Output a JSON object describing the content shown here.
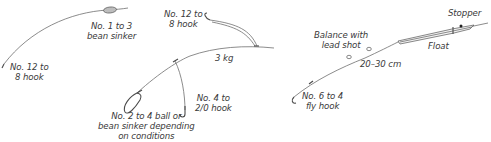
{
  "diagram": {
    "rigs": [
      {
        "name": "running-sinker-rig",
        "labels": {
          "sinker": [
            "No. 1 to 3",
            "bean sinker"
          ],
          "hook": [
            "No. 12 to",
            "8 hook"
          ]
        }
      },
      {
        "name": "paternoster-rig",
        "labels": {
          "top_hook": [
            "No. 12 to",
            "8 hook"
          ],
          "line_weight": "3 kg",
          "dropper_hook": [
            "No. 4 to",
            "2/0 hook"
          ],
          "sinker": [
            "No. 2 to 4 ball or",
            "bean sinker depending",
            "on conditions"
          ]
        }
      },
      {
        "name": "float-rig",
        "labels": {
          "stopper": "Stopper",
          "float": "Float",
          "shot": [
            "Balance with",
            "lead shot"
          ],
          "distance": "20–30 cm",
          "hook": [
            "No. 6 to 4",
            "fly hook"
          ]
        }
      }
    ],
    "colors": {
      "line": "#6e6e6e",
      "text": "#3a3a3a",
      "sinker_fill": "#bdbdbd",
      "background": "#ffffff"
    }
  }
}
